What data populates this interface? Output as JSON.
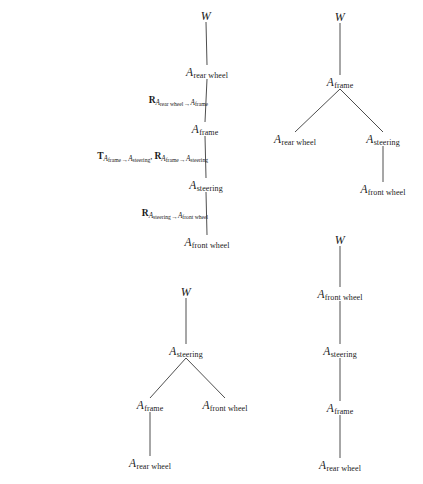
{
  "figure": {
    "caption": "",
    "background_color": "#ffffff",
    "line_color": "#3a3a3a",
    "text_color": "#1a1a1a",
    "frame_symbol": "A",
    "world_symbol": "W",
    "trees": [
      {
        "id": "tree-top-left",
        "nodes": [
          {
            "id": "tl-w",
            "label_symbol": "W",
            "label_sub": "",
            "x": 206,
            "y": 16
          },
          {
            "id": "tl-rear",
            "label_symbol": "A",
            "label_sub": "rear wheel",
            "x": 207,
            "y": 73
          },
          {
            "id": "tl-frame",
            "label_symbol": "A",
            "label_sub": "frame",
            "x": 205,
            "y": 130
          },
          {
            "id": "tl-steer",
            "label_symbol": "A",
            "label_sub": "steering",
            "x": 206,
            "y": 186
          },
          {
            "id": "tl-front",
            "label_symbol": "A",
            "label_sub": "front wheel",
            "x": 207,
            "y": 243
          }
        ],
        "edges": [
          {
            "from": "tl-w",
            "to": "tl-rear"
          },
          {
            "from": "tl-rear",
            "to": "tl-frame"
          },
          {
            "from": "tl-frame",
            "to": "tl-steer"
          },
          {
            "from": "tl-steer",
            "to": "tl-front"
          }
        ],
        "edge_labels": [
          {
            "id": "label-rear-to-frame",
            "x": 208,
            "y": 101,
            "terms": [
              {
                "bold": "R",
                "from_sub": "rear wheel",
                "to_sub": "frame"
              }
            ]
          },
          {
            "id": "label-frame-to-steering",
            "x": 208,
            "y": 157,
            "terms": [
              {
                "bold": "T",
                "from_sub": "frame",
                "to_sub": "steering"
              },
              {
                "bold": "R",
                "from_sub": "frame",
                "to_sub": "steering"
              }
            ]
          },
          {
            "id": "label-steering-to-front",
            "x": 208,
            "y": 214,
            "terms": [
              {
                "bold": "R",
                "from_sub": "steering",
                "to_sub": "front wheel"
              }
            ]
          }
        ]
      },
      {
        "id": "tree-top-right",
        "nodes": [
          {
            "id": "tr-w",
            "label_symbol": "W",
            "label_sub": "",
            "x": 340,
            "y": 17
          },
          {
            "id": "tr-frame",
            "label_symbol": "A",
            "label_sub": "frame",
            "x": 340,
            "y": 83
          },
          {
            "id": "tr-rear",
            "label_symbol": "A",
            "label_sub": "rear wheel",
            "x": 295,
            "y": 140
          },
          {
            "id": "tr-steer",
            "label_symbol": "A",
            "label_sub": "steering",
            "x": 383,
            "y": 140
          },
          {
            "id": "tr-front",
            "label_symbol": "A",
            "label_sub": "front wheel",
            "x": 383,
            "y": 190
          }
        ],
        "edges": [
          {
            "from": "tr-w",
            "to": "tr-frame"
          },
          {
            "from": "tr-frame",
            "to": "tr-rear"
          },
          {
            "from": "tr-frame",
            "to": "tr-steer"
          },
          {
            "from": "tr-steer",
            "to": "tr-front"
          }
        ],
        "edge_labels": []
      },
      {
        "id": "tree-bottom-left",
        "nodes": [
          {
            "id": "bl-w",
            "label_symbol": "W",
            "label_sub": "",
            "x": 186,
            "y": 292
          },
          {
            "id": "bl-steer",
            "label_symbol": "A",
            "label_sub": "steering",
            "x": 186,
            "y": 352
          },
          {
            "id": "bl-frame",
            "label_symbol": "A",
            "label_sub": "frame",
            "x": 150,
            "y": 406
          },
          {
            "id": "bl-front",
            "label_symbol": "A",
            "label_sub": "front wheel",
            "x": 225,
            "y": 406
          },
          {
            "id": "bl-rear",
            "label_symbol": "A",
            "label_sub": "rear wheel",
            "x": 150,
            "y": 464
          }
        ],
        "edges": [
          {
            "from": "bl-w",
            "to": "bl-steer"
          },
          {
            "from": "bl-steer",
            "to": "bl-frame"
          },
          {
            "from": "bl-steer",
            "to": "bl-front"
          },
          {
            "from": "bl-frame",
            "to": "bl-rear"
          }
        ],
        "edge_labels": []
      },
      {
        "id": "tree-bottom-right",
        "nodes": [
          {
            "id": "br-w",
            "label_symbol": "W",
            "label_sub": "",
            "x": 340,
            "y": 240
          },
          {
            "id": "br-front",
            "label_symbol": "A",
            "label_sub": "front wheel",
            "x": 340,
            "y": 295
          },
          {
            "id": "br-steer",
            "label_symbol": "A",
            "label_sub": "steering",
            "x": 340,
            "y": 352
          },
          {
            "id": "br-frame",
            "label_symbol": "A",
            "label_sub": "frame",
            "x": 340,
            "y": 409
          },
          {
            "id": "br-rear",
            "label_symbol": "A",
            "label_sub": "rear wheel",
            "x": 340,
            "y": 466
          }
        ],
        "edges": [
          {
            "from": "br-w",
            "to": "br-front"
          },
          {
            "from": "br-front",
            "to": "br-steer"
          },
          {
            "from": "br-steer",
            "to": "br-frame"
          },
          {
            "from": "br-frame",
            "to": "br-rear"
          }
        ],
        "edge_labels": []
      }
    ]
  }
}
